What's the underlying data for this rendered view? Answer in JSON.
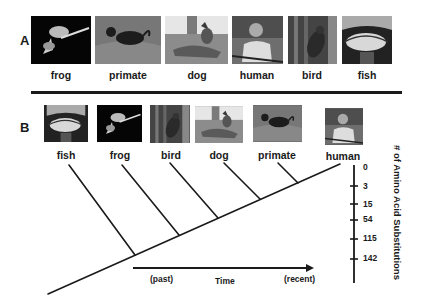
{
  "panel_a": {
    "letter": "A",
    "organisms": [
      {
        "name": "frog",
        "photo": "frog-photo"
      },
      {
        "name": "primate",
        "photo": "primate-photo"
      },
      {
        "name": "dog",
        "photo": "dog-photo"
      },
      {
        "name": "human",
        "photo": "human-photo"
      },
      {
        "name": "bird",
        "photo": "bird-photo"
      },
      {
        "name": "fish",
        "photo": "fish-photo"
      }
    ]
  },
  "panel_b": {
    "letter": "B",
    "organisms": [
      {
        "name": "fish",
        "photo": "fish-photo"
      },
      {
        "name": "frog",
        "photo": "frog-photo"
      },
      {
        "name": "bird",
        "photo": "bird-photo"
      },
      {
        "name": "dog",
        "photo": "dog-photo"
      },
      {
        "name": "primate",
        "photo": "primate-photo"
      },
      {
        "name": "human",
        "photo": "human-photo"
      }
    ],
    "scale": {
      "label": "# of Amino Acid Substitutions",
      "ticks": [
        "0",
        "3",
        "15",
        "54",
        "115",
        "142"
      ]
    },
    "time_axis": {
      "label": "Time",
      "start": "(past)",
      "end": "(recent)"
    }
  },
  "colors": {
    "ink": "#1a1a1a",
    "background": "#ffffff"
  }
}
